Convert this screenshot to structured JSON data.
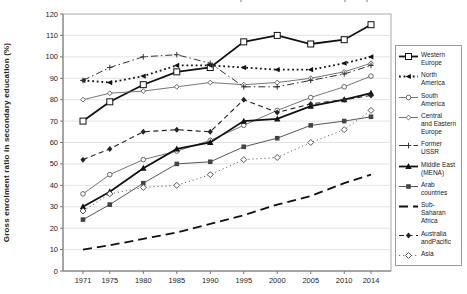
{
  "chart_data": {
    "type": "line",
    "title": "",
    "xlabel": "",
    "ylabel": "Gross enrolment ratio in secondary education (%)",
    "categories": [
      1971,
      1975,
      1980,
      1985,
      1990,
      1995,
      2000,
      2005,
      2010,
      2014
    ],
    "ylim": [
      0,
      120
    ],
    "ytick_step": 10,
    "grid": true,
    "legend_position": "right",
    "series": [
      {
        "name": "Western Europe",
        "legend_lines": [
          "Western",
          "Europe"
        ],
        "values": [
          70,
          79,
          87,
          93,
          95,
          107,
          110,
          106,
          108,
          115
        ],
        "line": "solid",
        "width": 1.8,
        "marker": "open-square",
        "color": "#111111"
      },
      {
        "name": "North America",
        "legend_lines": [
          "North",
          "America"
        ],
        "values": [
          89,
          88,
          91,
          96,
          96,
          95,
          94,
          94,
          97,
          100
        ],
        "line": "dot",
        "width": 1.8,
        "marker": "triangle-left",
        "color": "#111111"
      },
      {
        "name": "South America",
        "legend_lines": [
          "South",
          "America"
        ],
        "values": [
          36,
          45,
          52,
          56,
          61,
          68,
          75,
          81,
          86,
          91
        ],
        "line": "solid",
        "width": 0.9,
        "marker": "open-circle",
        "color": "#666666"
      },
      {
        "name": "Central and Eastern Europe",
        "legend_lines": [
          "Central",
          "and Eastern",
          "Europe"
        ],
        "values": [
          80,
          83,
          84,
          86,
          88,
          87,
          88,
          90,
          93,
          97
        ],
        "line": "solid",
        "width": 0.9,
        "marker": "open-diamond-small",
        "color": "#666666"
      },
      {
        "name": "Former USSR",
        "legend_lines": [
          "Former",
          "USSR"
        ],
        "values": [
          89,
          95,
          100,
          101,
          97,
          86,
          86,
          89,
          92,
          96
        ],
        "line": "dashdot",
        "width": 1.0,
        "marker": "plus",
        "color": "#333333"
      },
      {
        "name": "Middle East (MENA)",
        "legend_lines": [
          "Middle East",
          "(MENA)"
        ],
        "values": [
          30,
          37,
          48,
          57,
          60,
          70,
          71,
          77,
          80,
          83
        ],
        "line": "solid",
        "width": 1.8,
        "marker": "triangle-up",
        "color": "#111111"
      },
      {
        "name": "Arab countries",
        "legend_lines": [
          "Arab",
          "countries"
        ],
        "values": [
          24,
          31,
          41,
          50,
          51,
          58,
          62,
          68,
          70,
          72
        ],
        "line": "solid",
        "width": 0.9,
        "marker": "filled-square",
        "color": "#444444"
      },
      {
        "name": "Sub-Saharan Africa",
        "legend_lines": [
          "Sub-Saharan",
          "Africa"
        ],
        "values": [
          10,
          12,
          15,
          18,
          22,
          26,
          31,
          35,
          41,
          45
        ],
        "line": "longdash",
        "width": 1.8,
        "marker": "none",
        "color": "#111111"
      },
      {
        "name": "Australia and Pacific",
        "legend_lines": [
          "Australia",
          "andPacific"
        ],
        "values": [
          52,
          57,
          65,
          66,
          65,
          80,
          74,
          78,
          80,
          82
        ],
        "line": "dash",
        "width": 1.1,
        "marker": "filled-diamond",
        "color": "#222222"
      },
      {
        "name": "Asia",
        "legend_lines": [
          "Asia"
        ],
        "values": [
          28,
          36,
          39,
          40,
          45,
          52,
          53,
          60,
          66,
          75
        ],
        "line": "finedot",
        "width": 0.9,
        "marker": "open-diamond",
        "color": "#555555"
      }
    ]
  }
}
